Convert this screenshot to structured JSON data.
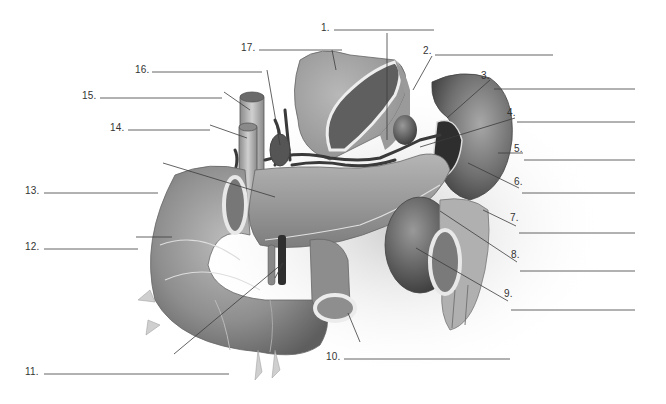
{
  "diagram": {
    "background": "#ffffff",
    "organ_fill": "#8a8a8a",
    "line_color": "#555555",
    "labels": [
      {
        "number": "1.",
        "blank": ""
      },
      {
        "number": "2.",
        "blank": ""
      },
      {
        "number": "3.",
        "blank": ""
      },
      {
        "number": "4.",
        "blank": ""
      },
      {
        "number": "5.",
        "blank": ""
      },
      {
        "number": "6.",
        "blank": ""
      },
      {
        "number": "7.",
        "blank": ""
      },
      {
        "number": "8.",
        "blank": ""
      },
      {
        "number": "9.",
        "blank": ""
      },
      {
        "number": "10.",
        "blank": ""
      },
      {
        "number": "11.",
        "blank": ""
      },
      {
        "number": "12.",
        "blank": ""
      },
      {
        "number": "13.",
        "blank": ""
      },
      {
        "number": "14.",
        "blank": ""
      },
      {
        "number": "15.",
        "blank": ""
      },
      {
        "number": "16.",
        "blank": ""
      },
      {
        "number": "17.",
        "blank": ""
      }
    ]
  }
}
